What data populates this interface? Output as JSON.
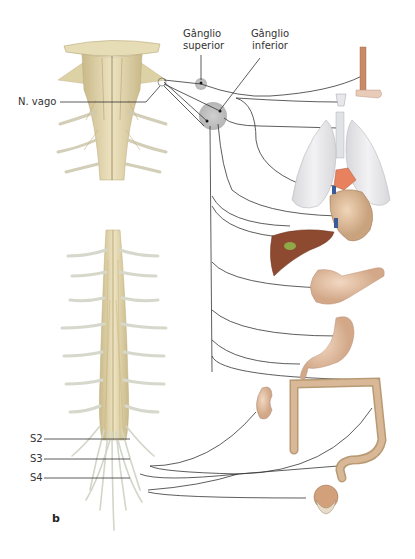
{
  "figure": {
    "panel_letter": "b",
    "labels": {
      "nerve": "N. vago",
      "ganglion_superior_line1": "Gânglio",
      "ganglion_superior_line2": "superior",
      "ganglion_inferior_line1": "Gânglio",
      "ganglion_inferior_line2": "inferior",
      "s2": "S2",
      "s3": "S3",
      "s4": "S4"
    },
    "structures": {
      "upper": "Tronco encefálico e medula cervical",
      "lower": "Medula espinal e raízes sacrais"
    },
    "organs": [
      "tongue",
      "larynx",
      "lungs",
      "heart",
      "liver",
      "pancreas",
      "stomach",
      "colon",
      "kidney",
      "rectum",
      "bladder"
    ],
    "colors": {
      "nerve_line": "#333333",
      "spinal_cord": "#d8cc9a",
      "ganglion": "#c8c8c8",
      "organ_pink": "#d9a98a",
      "liver": "#8b4a32",
      "lung": "#e6e6e8",
      "heart_vessel": "#e07a5a"
    }
  }
}
